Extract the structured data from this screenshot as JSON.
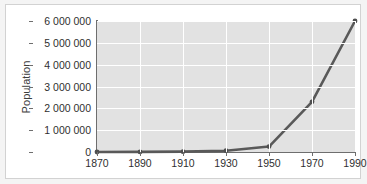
{
  "chart_data": {
    "type": "line",
    "title": "",
    "subtitle": "",
    "xlabel": "",
    "ylabel": "Population",
    "x": [
      1870,
      1890,
      1910,
      1930,
      1950,
      1970,
      1990
    ],
    "values": [
      1000,
      5000,
      15000,
      60000,
      250000,
      2300000,
      6000000
    ],
    "series": [
      {
        "name": "Population",
        "values": [
          1000,
          5000,
          15000,
          60000,
          250000,
          2300000,
          6000000
        ]
      }
    ],
    "xlim": [
      1870,
      1990
    ],
    "ylim": [
      0,
      6000000
    ],
    "x_tick_labels": [
      "1870",
      "1890",
      "1910",
      "1930",
      "1950",
      "1970",
      "1990"
    ],
    "y_tick_values": [
      0,
      1000000,
      2000000,
      3000000,
      4000000,
      5000000,
      6000000
    ],
    "y_tick_labels": [
      "0",
      "1 000 000",
      "2 000 000",
      "3 000 000",
      "4 000 000",
      "5 000 000",
      "6 000 000"
    ],
    "grid": true,
    "grid_axis": "both",
    "legend": false,
    "legend_position": "none",
    "annotations": [],
    "marker": "circle",
    "colors": {
      "line": "#595959",
      "marker": "#4f4f4f",
      "plot_background": "#e2e2e2",
      "gridline": "#ffffff",
      "axis": "#6e6e6e",
      "tick_text": "#2f2f2f",
      "axis_title": "#3c3c3c",
      "card_background": "#ffffff",
      "card_border": "#d2d2d2",
      "page_background": "#f4f4f4"
    }
  }
}
